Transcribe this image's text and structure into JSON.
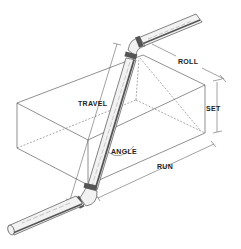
{
  "diagram": {
    "type": "isometric piping offset diagram",
    "labels": {
      "travel": "TRAVEL",
      "roll": "ROLL",
      "set": "SET",
      "angle": "ANGLE",
      "run": "RUN"
    },
    "colors": {
      "line": "#333333",
      "pipe_fill": "#f2f2f2",
      "pipe_shade": "#555555",
      "background": "#ffffff"
    }
  }
}
